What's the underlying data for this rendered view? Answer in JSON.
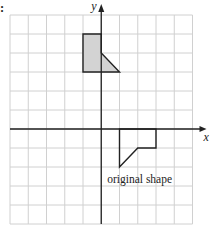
{
  "diagram": {
    "type": "coordinate-grid",
    "prefix_mark": ":",
    "axes": {
      "x_label": "x",
      "y_label": "y",
      "x_range": [
        -5,
        5
      ],
      "y_range": [
        -5,
        6
      ]
    },
    "grid": {
      "columns": 10,
      "rows": 11,
      "line_color": "#d0d0d0",
      "axis_color": "#222222"
    },
    "shapes": [
      {
        "name": "image-shape",
        "fill": "#d3d3d3",
        "stroke": "#222222",
        "vertices": [
          [
            -1,
            5
          ],
          [
            0,
            5
          ],
          [
            0,
            4
          ],
          [
            1,
            3
          ],
          [
            -1,
            3
          ]
        ]
      },
      {
        "name": "original-shape",
        "fill": "none",
        "stroke": "#222222",
        "vertices": [
          [
            1,
            0
          ],
          [
            3,
            0
          ],
          [
            3,
            -1
          ],
          [
            2,
            -1
          ],
          [
            1,
            -2
          ]
        ],
        "label": "original shape"
      }
    ]
  }
}
